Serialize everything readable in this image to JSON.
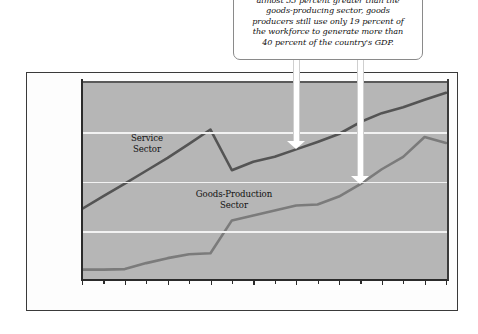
{
  "callout": {
    "text": "almost 33 percent greater than the\ngoods-producing sector, goods\nproducers still use only 19 percent of\nthe workforce to generate more than\n40 percent of the country's GDP."
  },
  "series_labels": {
    "service": "Service\nSector",
    "goods": "Goods-Production\nSector"
  },
  "colors": {
    "plot_background": "#b6b6b6",
    "gridline": "#f2f2f2",
    "service_line": "#545454",
    "goods_line": "#7b7b7b",
    "axis": "#2b2b2b",
    "arrow_fill": "#ffffff",
    "frame": "#3a3a3a",
    "page_background": "#ffffff"
  },
  "chart_data": {
    "type": "line",
    "title": "",
    "xlabel": "",
    "ylabel": "(billions)",
    "ylim": [
      1000,
      5000
    ],
    "yticks": [
      1000,
      2000,
      3000,
      4000
    ],
    "ytick_labels": [
      "$1,000",
      "$2,000",
      "$3,000",
      "$4,000"
    ],
    "grid": true,
    "legend": "inline-labels",
    "x": [
      1984,
      1985,
      1986,
      1987,
      1988,
      1989,
      1990,
      1991,
      1992,
      1993,
      1994,
      1995,
      1996,
      1997,
      1998,
      1999,
      2000,
      2001
    ],
    "xtick_labels": [
      "'84",
      "'86",
      "'88",
      "'90",
      "'92",
      "'94",
      "'96",
      "'98",
      "'00",
      "'01"
    ],
    "xtick_values": [
      1984,
      1986,
      1988,
      1990,
      1992,
      1994,
      1996,
      1998,
      2000,
      2001
    ],
    "series": [
      {
        "name": "Service Sector",
        "color": "#545454",
        "values": [
          2450,
          2710,
          2960,
          3220,
          3480,
          3760,
          4050,
          3230,
          3400,
          3500,
          3650,
          3800,
          3960,
          4200,
          4380,
          4500,
          4650,
          4790
        ]
      },
      {
        "name": "Goods-Production Sector",
        "color": "#7b7b7b",
        "values": [
          1230,
          1230,
          1240,
          1360,
          1460,
          1540,
          1560,
          2220,
          2320,
          2420,
          2520,
          2540,
          2700,
          2950,
          3250,
          3500,
          3900,
          3780
        ]
      }
    ]
  },
  "arrows": [
    {
      "name": "arrow-to-service-1994",
      "target_year": 1994,
      "target_series": "Service Sector"
    },
    {
      "name": "arrow-to-goods-1997",
      "target_year": 1997,
      "target_series": "Goods-Production Sector"
    }
  ]
}
